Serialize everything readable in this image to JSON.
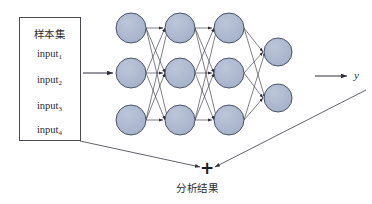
{
  "diagram": {
    "title_hidden": "",
    "sample_box": {
      "heading": "样本集",
      "inputs": [
        {
          "base": "input",
          "sub": "1",
          "name": "input-1"
        },
        {
          "base": "input",
          "sub": "2",
          "name": "input-2"
        },
        {
          "base": "input",
          "sub": "3",
          "name": "input-3"
        },
        {
          "base": "input",
          "sub": "4",
          "name": "input-4"
        }
      ]
    },
    "output_variable": "y",
    "combiner_symbol": "+",
    "result_label": "分析结果",
    "colors": {
      "node_fill": "#aab6cd",
      "node_stroke": "#4a5368",
      "edge": "#3a3a46",
      "box_stroke": "#4a4a55",
      "text": "#2b2b33",
      "background": "#ffffff"
    },
    "network": {
      "layer_labels": [
        "layer-1",
        "layer-2",
        "layer-3",
        "layer-4"
      ],
      "layer_node_counts": [
        3,
        3,
        3,
        2
      ],
      "node_radius": 15,
      "output_node_radius": 14,
      "layer_x": [
        131,
        180,
        229,
        278
      ],
      "row_y": [
        28,
        73,
        120
      ],
      "output_row_y": [
        52,
        98
      ]
    }
  }
}
